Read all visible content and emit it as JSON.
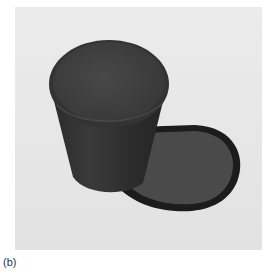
{
  "figure": {
    "caption": "(b)",
    "colors": {
      "background": "#e8e8e8",
      "cup_body": "#2e2e2e",
      "cup_rim": "#3a3a3a",
      "cup_interior": "#424242",
      "shadow_outline": "#1a1a1a",
      "shadow_fill": "#4a4a4a"
    }
  }
}
